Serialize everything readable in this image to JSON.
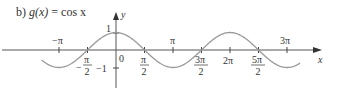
{
  "title": {
    "prefix": "b)",
    "lhs": "g(x)",
    "eq": "=",
    "rhs": "cos x"
  },
  "chart_data": {
    "type": "line",
    "title": "b) g(x) = cos x",
    "xlabel": "x",
    "ylabel": "y",
    "function": "cos(x)",
    "xlim": [
      -4.1,
      10.2
    ],
    "ylim": [
      -1,
      1
    ],
    "x_ticks": [
      "-π",
      "-π/2",
      "0",
      "π/2",
      "π",
      "3π/2",
      "2π",
      "5π/2",
      "3π"
    ],
    "y_ticks": [
      "1",
      "-1"
    ],
    "x": [
      -3.93,
      -3.14,
      -1.57,
      0,
      1.57,
      3.14,
      4.71,
      6.28,
      7.85,
      9.42,
      10.2
    ],
    "values": [
      -0.71,
      -1,
      0,
      1,
      0,
      -1,
      0,
      1,
      0,
      -1,
      -0.71
    ],
    "grid": false,
    "legend": null,
    "color": "#999999"
  },
  "labels": {
    "y_axis": "y",
    "x_axis": "x",
    "neg_pi": "−π",
    "pi": "π",
    "three_pi": "3π",
    "two_pi": "2π",
    "zero": "0",
    "one": "1",
    "neg_one": "−1",
    "minus": "−",
    "pi_num": "π",
    "three_pi_num": "3π",
    "five_pi_num": "5π",
    "den": "2"
  }
}
